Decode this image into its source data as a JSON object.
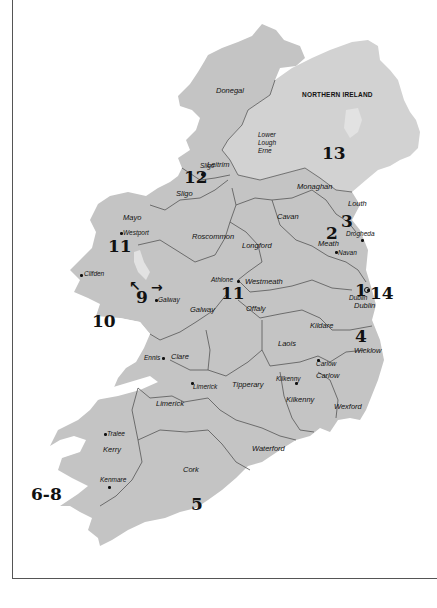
{
  "map": {
    "title": "Ireland",
    "colors": {
      "land": "#c4c4c4",
      "ni_land": "#d2d2d2",
      "water": "#ffffff",
      "border": "#555555",
      "lake": "#e2e2e2"
    },
    "region_label": "NORTHERN IRELAND",
    "counties": [
      {
        "name": "Donegal",
        "x": 216,
        "y": 87
      },
      {
        "name": "Leitrim",
        "x": 207,
        "y": 161
      },
      {
        "name": "Sligo",
        "x": 176,
        "y": 190
      },
      {
        "name": "Mayo",
        "x": 123,
        "y": 214
      },
      {
        "name": "Roscommon",
        "x": 192,
        "y": 233
      },
      {
        "name": "Cavan",
        "x": 277,
        "y": 213
      },
      {
        "name": "Monaghan",
        "x": 297,
        "y": 183
      },
      {
        "name": "Louth",
        "x": 348,
        "y": 200
      },
      {
        "name": "Longford",
        "x": 242,
        "y": 242
      },
      {
        "name": "Meath",
        "x": 318,
        "y": 240
      },
      {
        "name": "Westmeath",
        "x": 245,
        "y": 278
      },
      {
        "name": "Galway",
        "x": 190,
        "y": 306
      },
      {
        "name": "Offaly",
        "x": 246,
        "y": 305
      },
      {
        "name": "Dublin",
        "x": 354,
        "y": 302
      },
      {
        "name": "Kildare",
        "x": 310,
        "y": 322
      },
      {
        "name": "Laois",
        "x": 278,
        "y": 340
      },
      {
        "name": "Wicklow",
        "x": 354,
        "y": 347
      },
      {
        "name": "Clare",
        "x": 171,
        "y": 353
      },
      {
        "name": "Carlow",
        "x": 316,
        "y": 372
      },
      {
        "name": "Tipperary",
        "x": 232,
        "y": 381
      },
      {
        "name": "Kilkenny",
        "x": 286,
        "y": 396
      },
      {
        "name": "Wexford",
        "x": 334,
        "y": 403
      },
      {
        "name": "Limerick",
        "x": 156,
        "y": 400
      },
      {
        "name": "Kerry",
        "x": 103,
        "y": 446
      },
      {
        "name": "Waterford",
        "x": 252,
        "y": 445
      },
      {
        "name": "Cork",
        "x": 183,
        "y": 466
      }
    ],
    "lakes": [
      {
        "name": "Lower Lough Erne",
        "lines": [
          "Lower",
          "Lough",
          "Erne"
        ],
        "x": 258,
        "y": 132
      }
    ],
    "towns": [
      {
        "name": "Sligo",
        "x": 200,
        "y": 163,
        "dot_x": 201,
        "dot_y": 173,
        "label_left": true
      },
      {
        "name": "Westport",
        "x": 123,
        "y": 230,
        "dot_x": 120,
        "dot_y": 232
      },
      {
        "name": "Clifden",
        "x": 84,
        "y": 271,
        "dot_x": 80,
        "dot_y": 274
      },
      {
        "name": "Galway",
        "x": 158,
        "y": 297,
        "dot_x": 155,
        "dot_y": 299
      },
      {
        "name": "Athlone",
        "x": 211,
        "y": 277,
        "dot_x": 237,
        "dot_y": 280,
        "label_left": true
      },
      {
        "name": "Drogheda",
        "x": 346,
        "y": 231,
        "dot_x": 361,
        "dot_y": 239
      },
      {
        "name": "Navan",
        "x": 338,
        "y": 250,
        "dot_x": 335,
        "dot_y": 251
      },
      {
        "name": "Dublin",
        "x": 349,
        "y": 295,
        "dot_x": 367,
        "dot_y": 289
      },
      {
        "name": "Ennis",
        "x": 144,
        "y": 355,
        "dot_x": 162,
        "dot_y": 357,
        "label_left": true
      },
      {
        "name": "Limerick",
        "x": 193,
        "y": 384,
        "dot_x": 191,
        "dot_y": 382
      },
      {
        "name": "Carlow",
        "x": 316,
        "y": 361,
        "dot_x": 317,
        "dot_y": 359
      },
      {
        "name": "Kilkenny",
        "x": 276,
        "y": 376,
        "dot_x": 295,
        "dot_y": 382
      },
      {
        "name": "Tralee",
        "x": 107,
        "y": 431,
        "dot_x": 104,
        "dot_y": 433
      },
      {
        "name": "Kenmare",
        "x": 100,
        "y": 477,
        "dot_x": 108,
        "dot_y": 486
      }
    ],
    "numbers": [
      {
        "label": "1",
        "x": 355,
        "y": 282
      },
      {
        "label": "14",
        "x": 370,
        "y": 285
      },
      {
        "label": "2",
        "x": 326,
        "y": 225
      },
      {
        "label": "3",
        "x": 341,
        "y": 213
      },
      {
        "label": "4",
        "x": 355,
        "y": 328
      },
      {
        "label": "5",
        "x": 191,
        "y": 496
      },
      {
        "label": "6-8",
        "x": 31,
        "y": 486
      },
      {
        "label": "9",
        "x": 136,
        "y": 289
      },
      {
        "label": "10",
        "x": 92,
        "y": 313
      },
      {
        "label": "11",
        "x": 108,
        "y": 238
      },
      {
        "label": "11",
        "x": 221,
        "y": 285
      },
      {
        "label": "12",
        "x": 184,
        "y": 169
      },
      {
        "label": "13",
        "x": 322,
        "y": 145
      }
    ],
    "markers": [
      {
        "name": "arrow-up-left",
        "glyph": "↖",
        "x": 129,
        "y": 279
      },
      {
        "name": "arrow-right",
        "glyph": "→",
        "x": 151,
        "y": 280
      }
    ]
  }
}
